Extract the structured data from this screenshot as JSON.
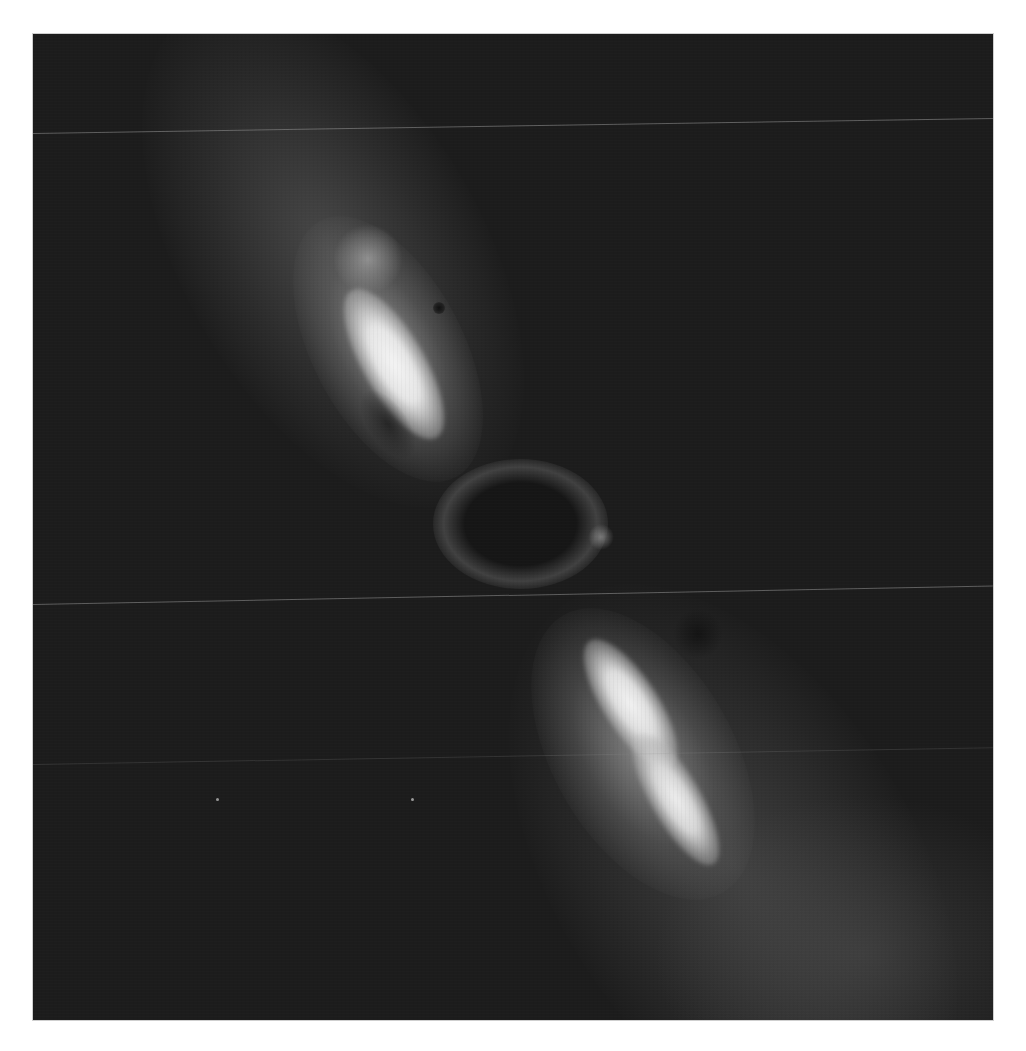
{
  "image": {
    "subject": "bipolar nebula outflow",
    "palette": {
      "background": "#1c1c1c",
      "nebula_diffuse": "#4a4a4a",
      "lobe_mid": "#9a9a9a",
      "lobe_core": "#f2f2f2",
      "scanline": "#969696",
      "frame_border": "#cfcfcf"
    },
    "features": [
      {
        "name": "upper-lobe",
        "center": [
          400,
          330
        ]
      },
      {
        "name": "lower-lobe",
        "center": [
          650,
          730
        ]
      },
      {
        "name": "central-cavity",
        "center": [
          515,
          520
        ]
      }
    ]
  }
}
